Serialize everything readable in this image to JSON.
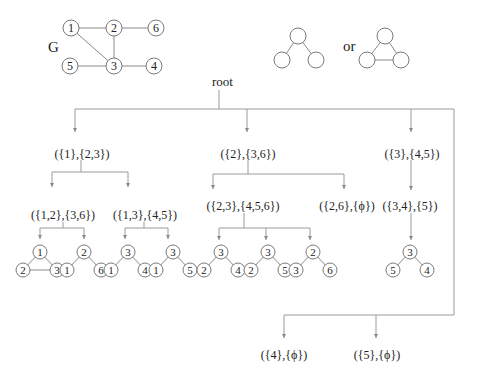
{
  "graph": {
    "label": "G",
    "nodes": [
      {
        "id": "1",
        "x": 71,
        "y": 28
      },
      {
        "id": "2",
        "x": 114,
        "y": 28
      },
      {
        "id": "6",
        "x": 156,
        "y": 28
      },
      {
        "id": "5",
        "x": 70,
        "y": 66
      },
      {
        "id": "3",
        "x": 114,
        "y": 66
      },
      {
        "id": "4",
        "x": 154,
        "y": 66
      }
    ],
    "edges": [
      [
        "1",
        "2"
      ],
      [
        "2",
        "6"
      ],
      [
        "1",
        "3"
      ],
      [
        "2",
        "3"
      ],
      [
        "5",
        "3"
      ],
      [
        "3",
        "4"
      ]
    ]
  },
  "motifs": {
    "or_label": "or",
    "path": {
      "top": [
        298,
        36
      ],
      "left": [
        282,
        60
      ],
      "right": [
        316,
        60
      ]
    },
    "triangle": {
      "top": [
        385,
        36
      ],
      "left": [
        367,
        60
      ],
      "right": [
        401,
        60
      ]
    }
  },
  "tree": {
    "root_label": "root",
    "level1": [
      {
        "label": "({1},{2,3})",
        "x": 82,
        "y": 153
      },
      {
        "label": "({2},{3,6})",
        "x": 248,
        "y": 153
      },
      {
        "label": "({3},{4,5})",
        "x": 412,
        "y": 153
      }
    ],
    "level2": [
      {
        "label": "({1,2},{3,6})",
        "x": 63,
        "y": 215
      },
      {
        "label": "({1,3},{4,5})",
        "x": 145,
        "y": 215
      },
      {
        "label": "({2,3},{4,5,6})",
        "x": 243,
        "y": 206
      },
      {
        "label": "({2,6},{ϕ})",
        "x": 347,
        "y": 206
      },
      {
        "label": "({3,4},{5})",
        "x": 410,
        "y": 206
      }
    ],
    "leaves": [
      {
        "label": "({4},{ϕ})",
        "x": 284,
        "y": 355
      },
      {
        "label": "({5},{ϕ})",
        "x": 377,
        "y": 355
      }
    ]
  },
  "subgraphs": [
    {
      "type": "triangle",
      "top": "1",
      "left": "2",
      "right": "3",
      "cx": 40,
      "cy": 252
    },
    {
      "type": "path",
      "top": "2",
      "left": "1",
      "right": "6",
      "cx": 84,
      "cy": 252
    },
    {
      "type": "path",
      "top": "3",
      "left": "1",
      "right": "4",
      "cx": 128,
      "cy": 252
    },
    {
      "type": "path",
      "top": "3",
      "left": "1",
      "right": "5",
      "cx": 173,
      "cy": 252
    },
    {
      "type": "path",
      "top": "3",
      "left": "2",
      "right": "4",
      "cx": 221,
      "cy": 252
    },
    {
      "type": "path",
      "top": "3",
      "left": "2",
      "right": "5",
      "cx": 268,
      "cy": 252
    },
    {
      "type": "path",
      "top": "2",
      "left": "3",
      "right": "6",
      "cx": 313,
      "cy": 252
    },
    {
      "type": "path",
      "top": "3",
      "left": "5",
      "right": "4",
      "cx": 410,
      "cy": 252
    }
  ]
}
